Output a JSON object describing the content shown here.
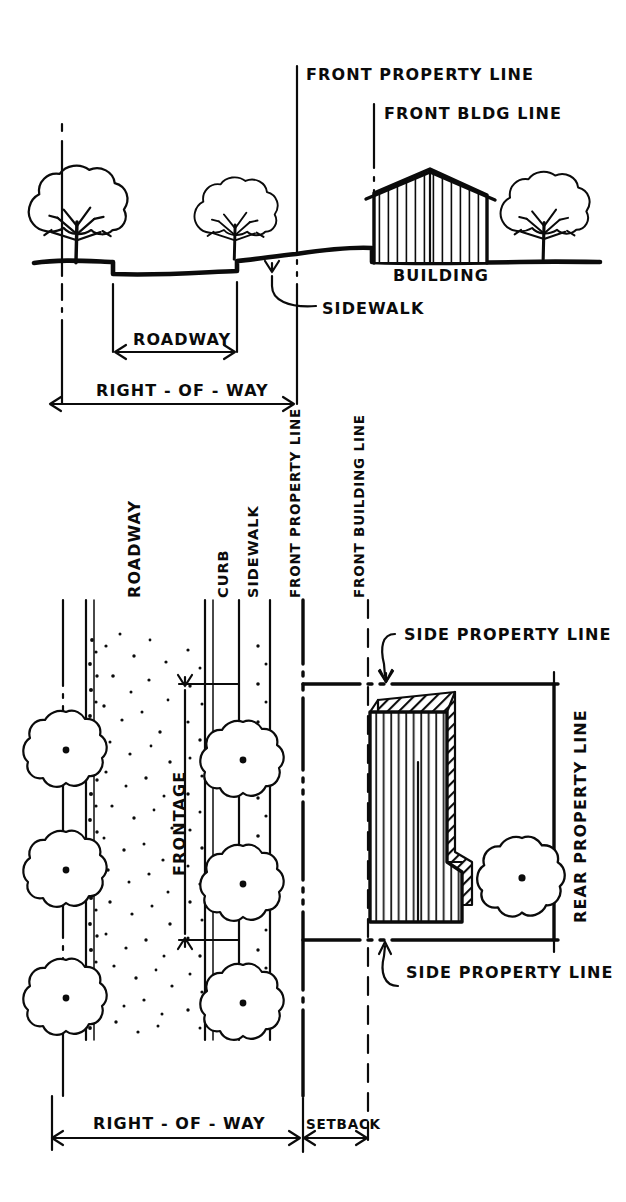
{
  "sheet": {
    "title": "Zoning terminology diagram",
    "ink_color": "#0b0b0b",
    "paper_color": "#ffffff"
  },
  "elevation": {
    "name": "street-cross-section-elevation",
    "labels": {
      "front_property_line": "FRONT PROPERTY LINE",
      "front_bldg_line": "FRONT BLDG LINE",
      "building": "BUILDING",
      "sidewalk": "SIDEWALK",
      "roadway": "ROADWAY",
      "right_of_way": "RIGHT - OF - WAY"
    }
  },
  "plan": {
    "name": "site-plan-view",
    "labels": {
      "roadway": "ROADWAY",
      "curb": "CURB",
      "sidewalk": "SIDEWALK",
      "front_property_line": "FRONT PROPERTY LINE",
      "front_building_line": "FRONT BUILDING LINE",
      "frontage": "FRONTAGE",
      "side_property_line_top": "SIDE PROPERTY LINE",
      "side_property_line_bottom": "SIDE PROPERTY LINE",
      "rear_property_line": "REAR PROPERTY LINE",
      "right_of_way": "RIGHT - OF - WAY",
      "setback": "SETBACK"
    }
  },
  "icons": {
    "tree_elevation": "tree-elevation-icon",
    "tree_plan": "tree-plan-icon",
    "arrow": "arrow-icon",
    "leader": "leader-arrow-icon"
  }
}
